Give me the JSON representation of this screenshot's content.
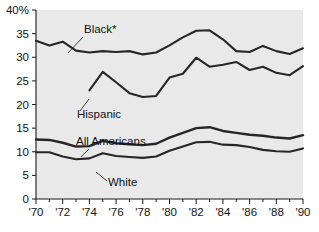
{
  "chart_data": {
    "type": "line",
    "title": "",
    "subtitle": "",
    "xlabel": "",
    "ylabel": "",
    "xlim": [
      1970,
      1990
    ],
    "ylim": [
      0,
      40
    ],
    "y_unit": "%",
    "grid": false,
    "legend": "inline-annotations",
    "y_ticks": [
      {
        "value": 40,
        "label": "40%"
      },
      {
        "value": 35,
        "label": "35"
      },
      {
        "value": 30,
        "label": "30"
      },
      {
        "value": 25,
        "label": "25"
      },
      {
        "value": 20,
        "label": "20"
      },
      {
        "value": 15,
        "label": "15"
      },
      {
        "value": 10,
        "label": "10"
      },
      {
        "value": 5,
        "label": "5"
      },
      {
        "value": 0,
        "label": "0"
      }
    ],
    "x_ticks_all": [
      1970,
      1971,
      1972,
      1973,
      1974,
      1975,
      1976,
      1977,
      1978,
      1979,
      1980,
      1981,
      1982,
      1983,
      1984,
      1985,
      1986,
      1987,
      1988,
      1989,
      1990
    ],
    "x_tick_labels": [
      {
        "value": 1970,
        "label": "'70"
      },
      {
        "value": 1972,
        "label": "'72"
      },
      {
        "value": 1974,
        "label": "'74"
      },
      {
        "value": 1976,
        "label": "'76"
      },
      {
        "value": 1978,
        "label": "'78"
      },
      {
        "value": 1980,
        "label": "'80"
      },
      {
        "value": 1982,
        "label": "'82"
      },
      {
        "value": 1984,
        "label": "'84"
      },
      {
        "value": 1986,
        "label": "'86"
      },
      {
        "value": 1988,
        "label": "'88"
      },
      {
        "value": 1990,
        "label": "'90"
      }
    ],
    "x": [
      1970,
      1971,
      1972,
      1973,
      1974,
      1975,
      1976,
      1977,
      1978,
      1979,
      1980,
      1981,
      1982,
      1983,
      1984,
      1985,
      1986,
      1987,
      1988,
      1989,
      1990
    ],
    "series": [
      {
        "name": "Black*",
        "label": "Black*",
        "color": "#262626",
        "width": 2.1,
        "x": [
          1970,
          1971,
          1972,
          1973,
          1974,
          1975,
          1976,
          1977,
          1978,
          1979,
          1980,
          1981,
          1982,
          1983,
          1984,
          1985,
          1986,
          1987,
          1988,
          1989,
          1990
        ],
        "values": [
          33.5,
          32.5,
          33.3,
          31.4,
          31.0,
          31.3,
          31.1,
          31.3,
          30.6,
          31.0,
          32.5,
          34.2,
          35.6,
          35.7,
          33.8,
          31.3,
          31.1,
          32.4,
          31.3,
          30.7,
          31.9
        ]
      },
      {
        "name": "Hispanic",
        "label": "Hispanic",
        "color": "#262626",
        "width": 2.1,
        "x": [
          1974,
          1975,
          1976,
          1977,
          1978,
          1979,
          1980,
          1981,
          1982,
          1983,
          1984,
          1985,
          1986,
          1987,
          1988,
          1989,
          1990
        ],
        "values": [
          23.0,
          26.9,
          24.7,
          22.4,
          21.6,
          21.8,
          25.7,
          26.5,
          29.9,
          28.0,
          28.4,
          29.0,
          27.3,
          28.0,
          26.7,
          26.2,
          28.1
        ]
      },
      {
        "name": "All Americans",
        "label": "All Americans",
        "color": "#1f1f1f",
        "width": 2.4,
        "x": [
          1970,
          1971,
          1972,
          1973,
          1974,
          1975,
          1976,
          1977,
          1978,
          1979,
          1980,
          1981,
          1982,
          1983,
          1984,
          1985,
          1986,
          1987,
          1988,
          1989,
          1990
        ],
        "values": [
          12.6,
          12.5,
          11.9,
          11.1,
          11.2,
          12.3,
          11.8,
          11.6,
          11.4,
          11.7,
          13.0,
          14.0,
          15.0,
          15.2,
          14.4,
          14.0,
          13.6,
          13.4,
          13.0,
          12.8,
          13.5
        ]
      },
      {
        "name": "White",
        "label": "White",
        "color": "#1f1f1f",
        "width": 2.1,
        "x": [
          1970,
          1971,
          1972,
          1973,
          1974,
          1975,
          1976,
          1977,
          1978,
          1979,
          1980,
          1981,
          1982,
          1983,
          1984,
          1985,
          1986,
          1987,
          1988,
          1989,
          1990
        ],
        "values": [
          9.9,
          9.9,
          9.0,
          8.4,
          8.6,
          9.7,
          9.1,
          8.9,
          8.7,
          9.0,
          10.2,
          11.1,
          12.0,
          12.1,
          11.5,
          11.4,
          11.0,
          10.4,
          10.1,
          10.0,
          10.7
        ]
      }
    ],
    "annotations": [
      {
        "name": "black-label",
        "text": "Black*",
        "text_x": 84,
        "text_y": 33,
        "leader": [
          [
            83,
            37
          ],
          [
            68,
            53
          ]
        ]
      },
      {
        "name": "hispanic-label",
        "text": "Hispanic",
        "text_x": 77,
        "text_y": 118,
        "leader": [
          [
            80,
            111
          ],
          [
            89,
            99
          ]
        ]
      },
      {
        "name": "all-americans-label",
        "text": "All Americans",
        "text_x": 76,
        "text_y": 145,
        "leader": [
          [
            89,
            149
          ],
          [
            81,
            157
          ]
        ]
      },
      {
        "name": "white-label",
        "text": "White",
        "text_x": 108,
        "text_y": 186,
        "leader": [
          [
            107,
            181
          ],
          [
            96,
            172
          ]
        ]
      }
    ]
  },
  "figure": {
    "plot_left": 36,
    "plot_right": 303,
    "plot_top": 10,
    "plot_bottom": 199,
    "bg_color": "#e9e9e9",
    "axis_color": "#1a1a1a",
    "page_bg": "#ffffff"
  }
}
